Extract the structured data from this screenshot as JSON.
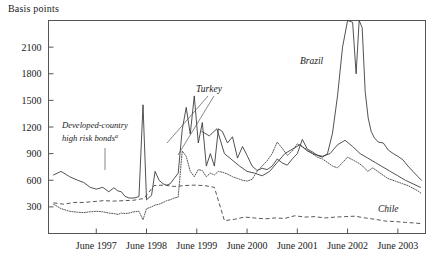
{
  "chart_data": {
    "type": "line",
    "title": "",
    "ylabel": "Basis points",
    "xlabel": "",
    "ylim": [
      0,
      2400
    ],
    "xlim": [
      1996.5,
      2004.0
    ],
    "grid": false,
    "legend_position": "inline-annotations",
    "ytick_labels": [
      "300",
      "600",
      "900",
      "1200",
      "1500",
      "1800",
      "2100"
    ],
    "ytick_values": [
      300,
      600,
      900,
      1200,
      1500,
      1800,
      2100
    ],
    "xtick_labels": [
      "June 1997",
      "June 1998",
      "June 1999",
      "June 2000",
      "June 2001",
      "June 2002",
      "June 2003"
    ],
    "xtick_values": [
      1997.45,
      1998.45,
      1999.45,
      2000.45,
      2001.45,
      2002.45,
      2003.45
    ],
    "annotations": [
      {
        "name": "developed-country-high-risk-bonds",
        "text_line1": "Developed-country",
        "text_line2": "high risk bonds",
        "superscript": "a",
        "style": "dotted"
      },
      {
        "name": "turkey",
        "text": "Turkey",
        "style": "solid"
      },
      {
        "name": "brazil",
        "text": "Brazil",
        "style": "solid"
      },
      {
        "name": "chile",
        "text": "Chile",
        "style": "dashed"
      }
    ],
    "series": [
      {
        "name": "Brazil",
        "style": "solid",
        "x": [
          1996.6,
          1996.75,
          1996.92,
          1997.08,
          1997.2,
          1997.33,
          1997.45,
          1997.58,
          1997.7,
          1997.8,
          1997.88,
          1997.95,
          1998.02,
          1998.1,
          1998.2,
          1998.3,
          1998.38,
          1998.45,
          1998.55,
          1998.62,
          1998.7,
          1998.78,
          1998.85,
          1998.92,
          1999.0,
          1999.08,
          1999.16,
          1999.24,
          1999.32,
          1999.4,
          1999.48,
          1999.56,
          1999.64,
          1999.72,
          1999.8,
          1999.88,
          1999.96,
          2000.06,
          2000.16,
          2000.26,
          2000.36,
          2000.45,
          2000.55,
          2000.65,
          2000.75,
          2000.85,
          2000.95,
          2001.05,
          2001.15,
          2001.25,
          2001.35,
          2001.45,
          2001.55,
          2001.65,
          2001.75,
          2001.85,
          2001.95,
          2002.05,
          2002.15,
          2002.25,
          2002.35,
          2002.45,
          2002.55,
          2002.62,
          2002.68,
          2002.74,
          2002.8,
          2002.86,
          2002.92,
          2002.98,
          2003.06,
          2003.16,
          2003.26,
          2003.36,
          2003.45,
          2003.55,
          2003.65,
          2003.75,
          2003.85,
          2003.92
        ],
        "values": [
          660,
          700,
          640,
          600,
          575,
          520,
          500,
          520,
          470,
          515,
          480,
          470,
          420,
          400,
          400,
          415,
          1450,
          380,
          430,
          700,
          600,
          560,
          545,
          560,
          620,
          680,
          1170,
          1420,
          1120,
          1550,
          1020,
          1250,
          760,
          900,
          760,
          1180,
          1150,
          1020,
          1090,
          850,
          980,
          880,
          760,
          710,
          735,
          720,
          760,
          840,
          795,
          770,
          840,
          900,
          1060,
          950,
          920,
          880,
          860,
          900,
          1130,
          1550,
          2100,
          2400,
          2380,
          1800,
          2400,
          2320,
          1600,
          1300,
          1150,
          1080,
          1030,
          1020,
          940,
          900,
          870,
          830,
          760,
          700,
          640,
          600
        ]
      },
      {
        "name": "Turkey",
        "style": "solid-secondary",
        "x": [
          1999.55,
          1999.7,
          1999.85,
          2000.0,
          2000.15,
          2000.3,
          2000.45,
          2000.6,
          2000.75,
          2000.9,
          2001.05,
          2001.2,
          2001.35,
          2001.5,
          2001.65,
          2001.8,
          2001.95,
          2002.1,
          2002.25,
          2002.4,
          2002.55,
          2002.7,
          2002.85,
          2003.0,
          2003.15,
          2003.3,
          2003.45,
          2003.6,
          2003.75,
          2003.9
        ],
        "values": [
          1150,
          1100,
          1180,
          900,
          830,
          760,
          700,
          680,
          650,
          700,
          800,
          900,
          950,
          1000,
          930,
          890,
          870,
          900,
          1000,
          1050,
          980,
          900,
          850,
          800,
          750,
          700,
          650,
          600,
          560,
          520
        ]
      },
      {
        "name": "Developed-country high risk bonds",
        "style": "dotted",
        "x": [
          1996.6,
          1996.75,
          1996.92,
          1997.08,
          1997.2,
          1997.33,
          1997.45,
          1997.58,
          1997.7,
          1997.8,
          1997.88,
          1997.95,
          1998.02,
          1998.1,
          1998.2,
          1998.3,
          1998.38,
          1998.45,
          1998.55,
          1998.62,
          1998.7,
          1998.78,
          1998.85,
          1998.92,
          1999.0,
          1999.08,
          1999.16,
          1999.24,
          1999.32,
          1999.4,
          1999.48,
          1999.56,
          1999.64,
          1999.72,
          1999.8,
          1999.88,
          1999.96,
          2000.06,
          2000.16,
          2000.26,
          2000.36,
          2000.45,
          2000.55,
          2000.65,
          2000.75,
          2000.85,
          2000.95,
          2001.05,
          2001.15,
          2001.25,
          2001.35,
          2001.45,
          2001.55,
          2001.65,
          2001.75,
          2001.85,
          2001.95,
          2002.05,
          2002.15,
          2002.25,
          2002.35,
          2002.45,
          2002.55,
          2002.65,
          2002.75,
          2002.85,
          2002.95,
          2003.05,
          2003.15,
          2003.25,
          2003.35,
          2003.45,
          2003.55,
          2003.65,
          2003.75,
          2003.85,
          2003.92
        ],
        "values": [
          330,
          280,
          250,
          240,
          235,
          245,
          250,
          245,
          230,
          225,
          215,
          230,
          225,
          230,
          245,
          250,
          155,
          280,
          300,
          320,
          330,
          350,
          370,
          380,
          400,
          410,
          930,
          870,
          700,
          640,
          720,
          710,
          640,
          680,
          660,
          700,
          690,
          670,
          640,
          620,
          600,
          590,
          610,
          700,
          760,
          820,
          900,
          1030,
          960,
          880,
          930,
          1010,
          980,
          940,
          900,
          860,
          840,
          800,
          760,
          740,
          800,
          860,
          830,
          800,
          760,
          700,
          740,
          700,
          660,
          620,
          600,
          580,
          560,
          540,
          510,
          480,
          450
        ]
      },
      {
        "name": "Chile",
        "style": "dashed",
        "x": [
          1996.6,
          1996.8,
          1997.0,
          1997.2,
          1997.4,
          1997.6,
          1997.8,
          1998.0,
          1998.2,
          1998.4,
          1998.6,
          1998.8,
          1999.0,
          1999.2,
          1999.4,
          1999.6,
          1999.8,
          2000.0,
          2000.2,
          2000.4,
          2000.6,
          2000.8,
          2001.0,
          2001.2,
          2001.4,
          2001.6,
          2001.8,
          2002.0,
          2002.2,
          2002.4,
          2002.6,
          2002.8,
          2003.0,
          2003.2,
          2003.4,
          2003.6,
          2003.8,
          2003.92
        ],
        "values": [
          345,
          330,
          350,
          350,
          360,
          370,
          365,
          370,
          375,
          395,
          540,
          545,
          530,
          540,
          545,
          540,
          520,
          145,
          160,
          185,
          175,
          165,
          175,
          170,
          200,
          185,
          190,
          175,
          185,
          190,
          195,
          175,
          160,
          140,
          135,
          125,
          118,
          110
        ]
      }
    ]
  },
  "meta": {
    "frame_color": "#555555",
    "line_color": "#333333"
  }
}
